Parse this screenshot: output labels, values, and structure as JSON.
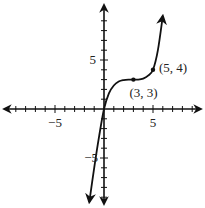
{
  "chart_data": {
    "type": "line",
    "title": "",
    "xlabel": "",
    "ylabel": "",
    "xlim": [
      -10,
      10
    ],
    "ylim": [
      -10,
      10
    ],
    "grid": false,
    "x_tick_labels": [
      "-5",
      "5"
    ],
    "y_tick_labels": [
      "5",
      "-5"
    ],
    "tick_step": 1,
    "series": [
      {
        "name": "f(x)",
        "description": "cubic-like curve rising from lower left, flattening near (3,3), rising steeply after (5,4)",
        "x": [
          -1.5,
          -1,
          -0.5,
          0,
          0.5,
          1,
          1.5,
          2,
          2.5,
          3,
          3.5,
          4,
          4.5,
          5,
          5.5,
          6
        ],
        "y": [
          -9.5,
          -6,
          -2.8,
          0,
          1.6,
          2.4,
          2.8,
          2.95,
          3.0,
          3.0,
          3.0,
          3.1,
          3.4,
          4,
          6,
          9.5
        ]
      }
    ],
    "annotations": [
      {
        "point": [
          3,
          3
        ],
        "label": "(3, 3)"
      },
      {
        "point": [
          5,
          4
        ],
        "label": "(5, 4)"
      }
    ],
    "axis_arrows": true,
    "curve_arrows": true
  }
}
